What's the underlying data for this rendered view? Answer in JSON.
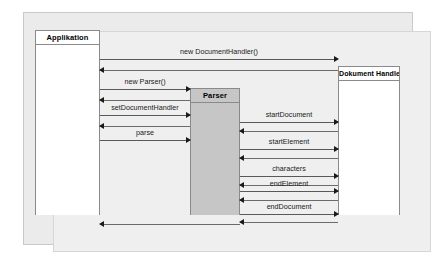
{
  "diagram": {
    "type": "uml-sequence-diagram",
    "title": "",
    "colors": {
      "frame_background": "#ebebeb",
      "inner_background": "#efefef",
      "participant_border": "#8a8a8a",
      "participant_fill_white": "#ffffff",
      "participant_fill_gray": "#c6c6c6",
      "arrow_line": "#595959",
      "arrow_head": "#1a1a1a",
      "label_text": "#1a1a1a"
    },
    "participants": [
      {
        "id": "application",
        "label": "Applikation",
        "fill": "white"
      },
      {
        "id": "parser",
        "label": "Parser",
        "fill": "gray"
      },
      {
        "id": "document_handler",
        "label": "Dokument Handler",
        "fill": "white"
      }
    ],
    "messages": [
      {
        "index": 1,
        "label": "new DocumentHandler()",
        "from": "application",
        "to": "document_handler",
        "direction": "right",
        "kind": "call"
      },
      {
        "index": 2,
        "label": "",
        "from": "document_handler",
        "to": "application",
        "direction": "left",
        "kind": "return"
      },
      {
        "index": 3,
        "label": "new Parser()",
        "from": "application",
        "to": "parser",
        "direction": "right",
        "kind": "call"
      },
      {
        "index": 4,
        "label": "",
        "from": "parser",
        "to": "application",
        "direction": "left",
        "kind": "return"
      },
      {
        "index": 5,
        "label": "setDocumentHandler",
        "from": "application",
        "to": "parser",
        "direction": "right",
        "kind": "call"
      },
      {
        "index": 6,
        "label": "",
        "from": "parser",
        "to": "application",
        "direction": "left",
        "kind": "return"
      },
      {
        "index": 7,
        "label": "parse",
        "from": "application",
        "to": "parser",
        "direction": "right",
        "kind": "call"
      },
      {
        "index": 8,
        "label": "startDocument",
        "from": "parser",
        "to": "document_handler",
        "direction": "right",
        "kind": "call"
      },
      {
        "index": 9,
        "label": "",
        "from": "document_handler",
        "to": "parser",
        "direction": "left",
        "kind": "return"
      },
      {
        "index": 10,
        "label": "startElement",
        "from": "parser",
        "to": "document_handler",
        "direction": "right",
        "kind": "call"
      },
      {
        "index": 11,
        "label": "",
        "from": "document_handler",
        "to": "parser",
        "direction": "left",
        "kind": "return"
      },
      {
        "index": 12,
        "label": "characters",
        "from": "parser",
        "to": "document_handler",
        "direction": "right",
        "kind": "call"
      },
      {
        "index": 13,
        "label": "",
        "from": "document_handler",
        "to": "parser",
        "direction": "left",
        "kind": "return"
      },
      {
        "index": 14,
        "label": "endElement",
        "from": "parser",
        "to": "document_handler",
        "direction": "right",
        "kind": "call"
      },
      {
        "index": 15,
        "label": "",
        "from": "document_handler",
        "to": "parser",
        "direction": "left",
        "kind": "return"
      },
      {
        "index": 16,
        "label": "endDocument",
        "from": "parser",
        "to": "document_handler",
        "direction": "right",
        "kind": "call"
      },
      {
        "index": 17,
        "label": "",
        "from": "document_handler",
        "to": "parser",
        "direction": "left",
        "kind": "return"
      },
      {
        "index": 18,
        "label": "",
        "from": "parser",
        "to": "application",
        "direction": "left",
        "kind": "return"
      }
    ]
  }
}
